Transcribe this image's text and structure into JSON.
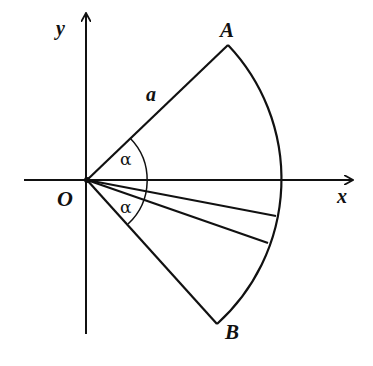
{
  "diagram": {
    "type": "geometry-sector",
    "labels": {
      "y_axis": "y",
      "x_axis": "x",
      "origin": "O",
      "point_a": "A",
      "point_b": "B",
      "radius": "a",
      "angle_upper": "α",
      "angle_lower": "α"
    },
    "colors": {
      "stroke": "#111111",
      "background": "#ffffff"
    }
  }
}
